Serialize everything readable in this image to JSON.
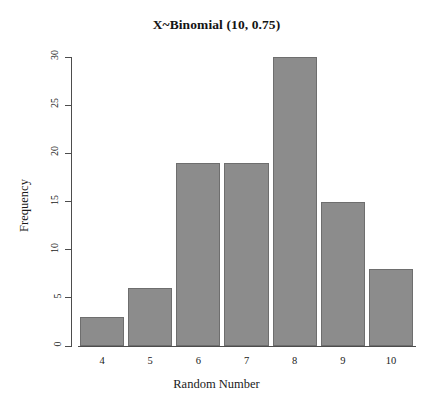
{
  "chart_data": {
    "type": "bar",
    "title": "X~Binomial (10, 0.75)",
    "xlabel": "Random Number",
    "ylabel": "Frequency",
    "categories": [
      "4",
      "5",
      "6",
      "7",
      "8",
      "9",
      "10"
    ],
    "values": [
      3,
      6,
      19,
      19,
      30,
      15,
      8
    ],
    "ylim": [
      0,
      30
    ],
    "yticks": [
      "0",
      "5",
      "10",
      "15",
      "20",
      "25",
      "30"
    ],
    "ytick_values": [
      0,
      5,
      10,
      15,
      20,
      25,
      30
    ],
    "grid": false,
    "legend": null,
    "bar_color": "#8c8c8c",
    "bar_border_color": "#6e6e6e",
    "axis_color": "#4d4d4d",
    "background": "#ffffff"
  }
}
